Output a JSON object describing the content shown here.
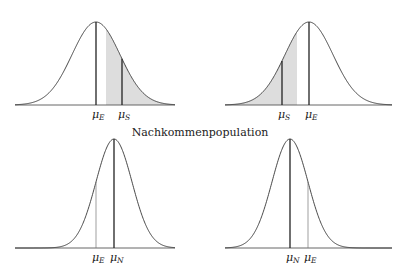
{
  "title": "Nachkommenpopulation",
  "panels": [
    {
      "id": "top-left",
      "x0": 15,
      "x1": 175,
      "baseline": 105,
      "peak_y": 22,
      "mu": 96,
      "sigma": 24,
      "shade_from": 107,
      "shade_to": 172,
      "lines": [
        {
          "x": 96,
          "style": "thick",
          "label": "μ",
          "sub": "E"
        },
        {
          "x": 122,
          "style": "thick",
          "label": "μ",
          "sub": "S"
        }
      ]
    },
    {
      "id": "top-right",
      "x0": 225,
      "x1": 392,
      "baseline": 105,
      "peak_y": 22,
      "mu": 309,
      "sigma": 24,
      "shade_from": 232,
      "shade_to": 297,
      "lines": [
        {
          "x": 282,
          "style": "thick",
          "label": "μ",
          "sub": "S"
        },
        {
          "x": 309,
          "style": "thick",
          "label": "μ",
          "sub": "E"
        }
      ]
    },
    {
      "id": "bottom-left",
      "x0": 15,
      "x1": 175,
      "baseline": 248,
      "peak_y": 139,
      "mu": 114,
      "sigma": 18,
      "lines": [
        {
          "x": 96,
          "style": "thin",
          "label": "μ",
          "sub": "E"
        },
        {
          "x": 114,
          "style": "thick",
          "label": "μ",
          "sub": "N"
        }
      ]
    },
    {
      "id": "bottom-right",
      "x0": 225,
      "x1": 392,
      "baseline": 248,
      "peak_y": 139,
      "mu": 290,
      "sigma": 18,
      "lines": [
        {
          "x": 290,
          "style": "thick",
          "label": "μ",
          "sub": "N"
        },
        {
          "x": 308,
          "style": "thin",
          "label": "μ",
          "sub": "E"
        }
      ]
    }
  ]
}
